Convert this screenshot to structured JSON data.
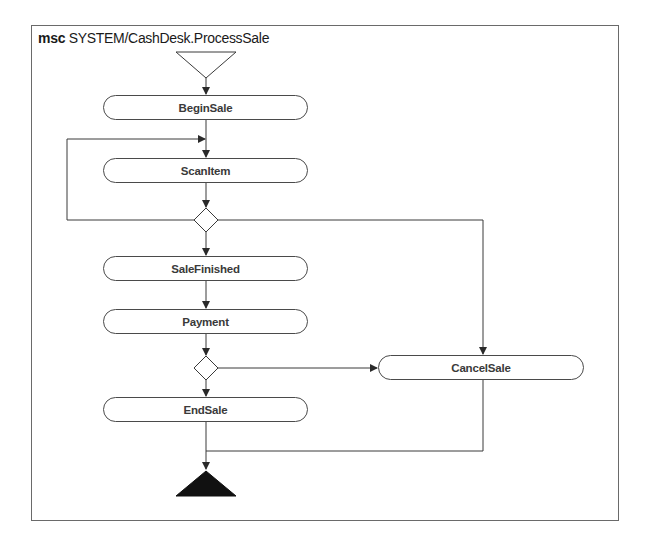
{
  "diagram": {
    "type": "activity-diagram",
    "title_keyword": "msc",
    "title_name": "SYSTEM/CashDesk.ProcessSale",
    "colors": {
      "stroke": "#3a3a3a",
      "frame": "#6a6a6a",
      "end_fill": "#111111",
      "text": "#3a3a3a"
    },
    "nodes": [
      {
        "id": "begin-sale",
        "label": "BeginSale"
      },
      {
        "id": "scan-item",
        "label": "ScanItem"
      },
      {
        "id": "sale-finished",
        "label": "SaleFinished"
      },
      {
        "id": "payment",
        "label": "Payment"
      },
      {
        "id": "cancel-sale",
        "label": "CancelSale"
      },
      {
        "id": "end-sale",
        "label": "EndSale"
      }
    ],
    "start": {
      "shape": "open-inverted-triangle"
    },
    "end": {
      "shape": "filled-triangle"
    },
    "decisions": [
      {
        "id": "decision-1",
        "after": "ScanItem",
        "branches": [
          "ScanItem (loop)",
          "SaleFinished",
          "CancelSale"
        ]
      },
      {
        "id": "decision-2",
        "after": "Payment",
        "branches": [
          "EndSale",
          "CancelSale"
        ]
      }
    ],
    "edges": [
      [
        "start",
        "BeginSale"
      ],
      [
        "BeginSale",
        "ScanItem"
      ],
      [
        "ScanItem",
        "decision-1"
      ],
      [
        "decision-1",
        "ScanItem"
      ],
      [
        "decision-1",
        "SaleFinished"
      ],
      [
        "decision-1",
        "CancelSale"
      ],
      [
        "SaleFinished",
        "Payment"
      ],
      [
        "Payment",
        "decision-2"
      ],
      [
        "decision-2",
        "EndSale"
      ],
      [
        "decision-2",
        "CancelSale"
      ],
      [
        "EndSale",
        "end"
      ],
      [
        "CancelSale",
        "end"
      ]
    ]
  }
}
